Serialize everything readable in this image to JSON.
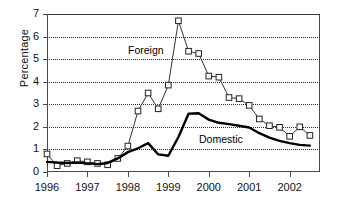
{
  "chart_data": {
    "type": "line",
    "title": "",
    "xlabel": "",
    "ylabel": "Percentage",
    "ylim": [
      0,
      7
    ],
    "yticks": [
      0,
      1,
      2,
      3,
      4,
      5,
      6,
      7
    ],
    "xticks": [
      "1996",
      "1997",
      "1998",
      "1999",
      "2000",
      "2001",
      "2002"
    ],
    "grid": "horizontal-dotted",
    "legend": "inline-annotations",
    "x": [
      1996.0,
      1996.25,
      1996.5,
      1996.75,
      1997.0,
      1997.25,
      1997.5,
      1997.75,
      1998.0,
      1998.25,
      1998.5,
      1998.75,
      1999.0,
      1999.25,
      1999.5,
      1999.75,
      2000.0,
      2000.25,
      2000.5,
      2000.75,
      2001.0,
      2001.25,
      2001.5,
      2001.75,
      2002.0,
      2002.25,
      2002.5
    ],
    "series": [
      {
        "name": "Foreign",
        "marker": "open-square",
        "line_color": "#333333",
        "values": [
          0.8,
          0.28,
          0.38,
          0.5,
          0.45,
          0.38,
          0.32,
          0.6,
          1.15,
          2.7,
          3.5,
          2.8,
          3.85,
          6.7,
          5.35,
          5.25,
          4.25,
          4.2,
          3.3,
          3.25,
          2.95,
          2.35,
          2.05,
          1.98,
          1.58,
          2.0,
          1.62
        ]
      },
      {
        "name": "Domestic",
        "marker": "none",
        "line_color": "#000000",
        "values": [
          0.45,
          0.42,
          0.4,
          0.42,
          0.38,
          0.35,
          0.4,
          0.6,
          0.88,
          1.05,
          1.28,
          0.78,
          0.72,
          1.55,
          2.58,
          2.6,
          2.32,
          2.18,
          2.12,
          2.05,
          1.97,
          1.72,
          1.52,
          1.38,
          1.28,
          1.2,
          1.17
        ]
      }
    ],
    "annotations": [
      {
        "text": "Foreign",
        "x_px": 128,
        "y_px": 44
      },
      {
        "text": "Domestic",
        "x_px": 199,
        "y_px": 133
      }
    ]
  }
}
